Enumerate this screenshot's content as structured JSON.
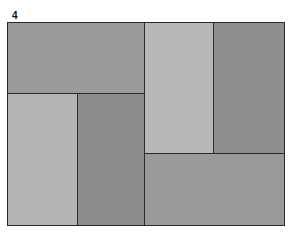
{
  "figure": {
    "label": "4",
    "rectangles": [
      {
        "name": "top-left",
        "x": 0,
        "y": 0,
        "w": 137,
        "h": 72,
        "color": "#9b9b9b"
      },
      {
        "name": "middle-left-light",
        "x": 0,
        "y": 71,
        "w": 71,
        "h": 132,
        "color": "#b5b5b5"
      },
      {
        "name": "middle-center-dark",
        "x": 70,
        "y": 71,
        "w": 68,
        "h": 132,
        "color": "#8c8c8c"
      },
      {
        "name": "top-center-light",
        "x": 137,
        "y": 0,
        "w": 69,
        "h": 132,
        "color": "#b7b7b7"
      },
      {
        "name": "top-right-dark",
        "x": 205,
        "y": 0,
        "w": 72,
        "h": 132,
        "color": "#8f8f8f"
      },
      {
        "name": "bottom-right",
        "x": 137,
        "y": 131,
        "w": 140,
        "h": 72,
        "color": "#9a9a9a"
      }
    ]
  }
}
